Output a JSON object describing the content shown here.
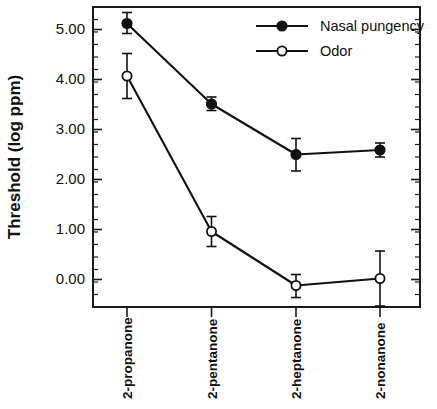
{
  "chart_data": {
    "type": "line",
    "title": "",
    "xlabel": "",
    "ylabel": "Threshold  (log  ppm)",
    "categories": [
      "2-propanone",
      "2-pentanone",
      "2-heptanone",
      "2-nonanone"
    ],
    "ylim": [
      -0.55,
      5.45
    ],
    "ytick_labels": [
      "0.00",
      "1.00",
      "2.00",
      "3.00",
      "4.00",
      "5.00"
    ],
    "ytick_values": [
      0.0,
      1.0,
      2.0,
      3.0,
      4.0,
      5.0
    ],
    "yminor_step": 0.25,
    "grid": false,
    "legend_position": "top-right",
    "series": [
      {
        "name": "Nasal pungency",
        "marker": "filled-circle",
        "values": [
          5.12,
          3.51,
          2.5,
          2.59
        ],
        "errors_upper": [
          0.22,
          0.14,
          0.32,
          0.14
        ],
        "errors_lower": [
          0.2,
          0.13,
          0.33,
          0.14
        ]
      },
      {
        "name": "Odor",
        "marker": "open-circle",
        "values": [
          4.07,
          0.96,
          -0.12,
          0.02
        ],
        "errors_upper": [
          0.45,
          0.3,
          0.22,
          0.55
        ],
        "errors_lower": [
          0.45,
          0.3,
          0.24,
          0.55
        ]
      }
    ]
  },
  "legend": {
    "items": [
      {
        "label": "Nasal pungency",
        "marker": "filled-circle"
      },
      {
        "label": "Odor",
        "marker": "open-circle"
      }
    ]
  },
  "axis": {
    "y_title": "Threshold  (log  ppm)"
  }
}
